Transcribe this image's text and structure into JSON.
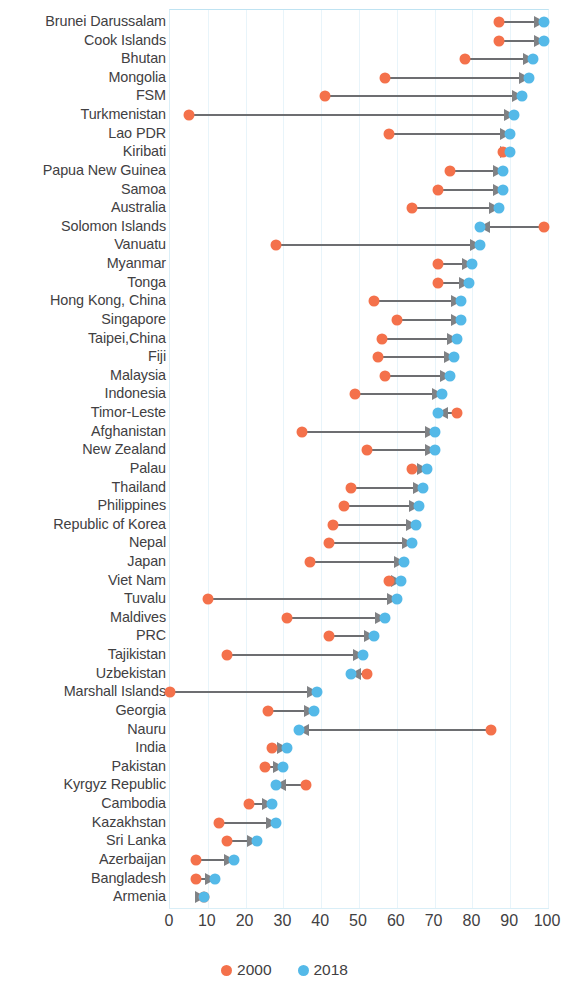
{
  "chart_data": {
    "type": "bar",
    "subtype": "dumbbell-arrow",
    "title": "",
    "xlabel": "",
    "ylabel": "",
    "xlim": [
      0,
      100
    ],
    "xticks": [
      0,
      10,
      20,
      30,
      40,
      50,
      60,
      70,
      80,
      90,
      100
    ],
    "grid": true,
    "legend_position": "bottom-center",
    "colors": {
      "series_2000": "#f4714b",
      "series_2018": "#54b9e8",
      "arrow": "#808285",
      "gridline": "#e8f4fa",
      "text": "#414042"
    },
    "series": [
      {
        "name": "2000",
        "values": [
          87,
          87,
          78,
          57,
          41,
          5,
          58,
          88,
          74,
          71,
          64,
          99,
          28,
          71,
          71,
          54,
          60,
          56,
          55,
          57,
          49,
          76,
          35,
          52,
          64,
          48,
          46,
          43,
          42,
          37,
          58,
          10,
          31,
          42,
          15,
          52,
          0,
          26,
          85,
          27,
          25,
          36,
          21,
          13,
          15,
          7,
          7,
          9
        ]
      },
      {
        "name": "2018",
        "values": [
          99,
          99,
          96,
          95,
          93,
          91,
          90,
          90,
          88,
          88,
          87,
          82,
          82,
          80,
          79,
          77,
          77,
          76,
          75,
          74,
          72,
          71,
          70,
          70,
          68,
          67,
          66,
          65,
          64,
          62,
          61,
          60,
          57,
          54,
          51,
          48,
          39,
          38,
          34,
          31,
          30,
          28,
          27,
          28,
          23,
          17,
          12,
          9
        ]
      }
    ],
    "categories": [
      "Brunei Darussalam",
      "Cook Islands",
      "Bhutan",
      "Mongolia",
      "FSM",
      "Turkmenistan",
      "Lao PDR",
      "Kiribati",
      "Papua New Guinea",
      "Samoa",
      "Australia",
      "Solomon Islands",
      "Vanuatu",
      "Myanmar",
      "Tonga",
      "Hong Kong, China",
      "Singapore",
      "Taipei,China",
      "Fiji",
      "Malaysia",
      "Indonesia",
      "Timor-Leste",
      "Afghanistan",
      "New Zealand",
      "Palau",
      "Thailand",
      "Philippines",
      "Republic of Korea",
      "Nepal",
      "Japan",
      "Viet Nam",
      "Tuvalu",
      "Maldives",
      "PRC",
      "Tajikistan",
      "Uzbekistan",
      "Marshall Islands",
      "Georgia",
      "Nauru",
      "India",
      "Pakistan",
      "Kyrgyz Republic",
      "Cambodia",
      "Kazakhstan",
      "Sri Lanka",
      "Azerbaijan",
      "Bangladesh",
      "Armenia"
    ]
  },
  "legend": {
    "items": [
      {
        "label": "2000",
        "color": "#f4714b"
      },
      {
        "label": "2018",
        "color": "#54b9e8"
      }
    ]
  },
  "axis": {
    "x_tick_labels": [
      "0",
      "10",
      "20",
      "30",
      "40",
      "50",
      "60",
      "70",
      "80",
      "90",
      "100"
    ]
  }
}
